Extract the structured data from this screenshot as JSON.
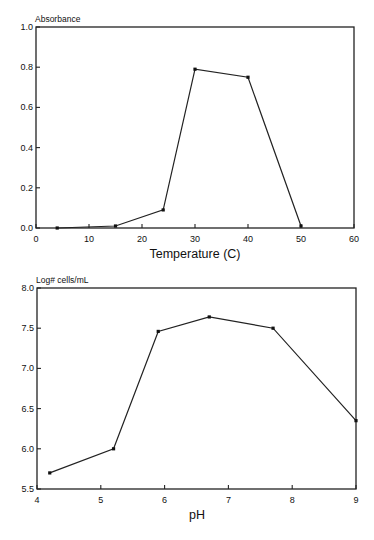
{
  "chart_data": [
    {
      "type": "line",
      "title": "",
      "xlabel": "Temperature (C)",
      "ylabel": "Absorbance",
      "xlim": [
        0,
        60
      ],
      "ylim": [
        0.0,
        1.0
      ],
      "xticks": [
        "0",
        "10",
        "20",
        "30",
        "40",
        "50",
        "60"
      ],
      "yticks": [
        "0.0",
        "0.2",
        "0.4",
        "0.6",
        "0.8",
        "1.0"
      ],
      "grid": false,
      "legend": null,
      "x": [
        4,
        15,
        24,
        30,
        40,
        50
      ],
      "y": [
        0.0,
        0.01,
        0.09,
        0.79,
        0.75,
        0.01
      ]
    },
    {
      "type": "line",
      "title": "",
      "xlabel": "pH",
      "ylabel": "Log# cells/mL",
      "xlim": [
        4,
        9
      ],
      "ylim": [
        5.5,
        8.0
      ],
      "xticks": [
        "4",
        "5",
        "6",
        "7",
        "8",
        "9"
      ],
      "yticks": [
        "5.5",
        "6.0",
        "6.5",
        "7.0",
        "7.5",
        "8.0"
      ],
      "grid": false,
      "legend": null,
      "x": [
        4.2,
        5.2,
        5.9,
        6.7,
        7.7,
        9.0
      ],
      "y": [
        5.7,
        6.0,
        7.46,
        7.64,
        7.5,
        6.35
      ]
    }
  ],
  "labels": {
    "chart1_ylabel": "Absorbance",
    "chart1_xlabel": "Temperature (C)",
    "chart2_ylabel": "Log# cells/mL",
    "chart2_xlabel": "pH"
  }
}
